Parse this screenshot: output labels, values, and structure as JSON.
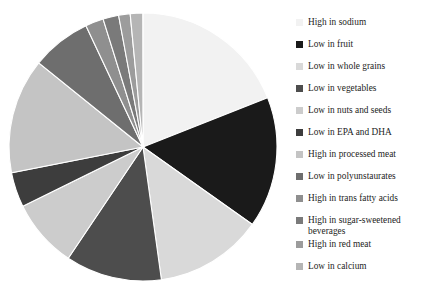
{
  "chart_data": {
    "type": "pie",
    "title": "",
    "subtitle": "",
    "xlabel": "",
    "ylabel": "",
    "grid": false,
    "legend_position": "right",
    "start_angle_deg": 0,
    "direction": "clockwise",
    "center_px": [
      143,
      147
    ],
    "radius_px": 134,
    "labels": [
      "High in sodium",
      "Low in fruit",
      "Low in whole grains",
      "Low in vegetables",
      "Low in nuts and seeds",
      "Low in EPA and DHA",
      "High in processed meat",
      "Low in polyunstaurates",
      "High in trans fatty acids",
      "High in sugar-sweetened beverages",
      "High in red meat",
      "Low in calcium"
    ],
    "values": [
      19.0,
      15.8,
      13.0,
      11.6,
      8.3,
      4.2,
      13.9,
      7.2,
      2.2,
      1.9,
      1.4,
      1.5
    ],
    "angles_deg": [
      68.4,
      56.9,
      46.8,
      41.8,
      29.9,
      15.1,
      50.0,
      25.9,
      7.9,
      6.8,
      5.0,
      5.4
    ],
    "colors": [
      "#f2f2f2",
      "#1a1a1a",
      "#d9d9d9",
      "#4d4d4d",
      "#cccccc",
      "#3d3d3d",
      "#c4c4c4",
      "#6e6e6e",
      "#8f8f8f",
      "#7a7a7a",
      "#9c9c9c",
      "#b5b5b5"
    ],
    "slice_edge_color": "#ffffff"
  },
  "legend": {
    "items": [
      {
        "label": "High in sodium",
        "color": "#f2f2f2",
        "top": 4,
        "lines": 1
      },
      {
        "label": "Low in fruit",
        "color": "#1a1a1a",
        "top": 26,
        "lines": 1
      },
      {
        "label": "Low in whole grains",
        "color": "#d9d9d9",
        "top": 48,
        "lines": 1
      },
      {
        "label": "Low in vegetables",
        "color": "#4d4d4d",
        "top": 70,
        "lines": 1
      },
      {
        "label": "Low in nuts and seeds",
        "color": "#cccccc",
        "top": 92,
        "lines": 1
      },
      {
        "label": "Low in EPA and DHA",
        "color": "#3d3d3d",
        "top": 114,
        "lines": 1
      },
      {
        "label": "High in processed meat",
        "color": "#c4c4c4",
        "top": 136,
        "lines": 1
      },
      {
        "label": "Low in polyunstaurates",
        "color": "#6e6e6e",
        "top": 158,
        "lines": 1
      },
      {
        "label": "High in trans fatty acids",
        "color": "#8f8f8f",
        "top": 180,
        "lines": 1
      },
      {
        "label": "High in sugar-sweetened\nbeverages",
        "color": "#7a7a7a",
        "top": 202,
        "lines": 2
      },
      {
        "label": "High in red meat",
        "color": "#9c9c9c",
        "top": 226,
        "lines": 1
      },
      {
        "label": "Low in calcium",
        "color": "#b5b5b5",
        "top": 248,
        "lines": 1
      }
    ]
  }
}
